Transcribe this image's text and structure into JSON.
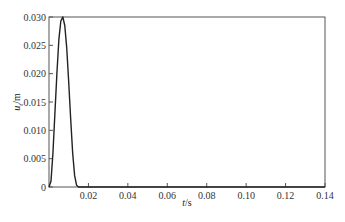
{
  "chart_data": {
    "type": "line",
    "title": "",
    "xlabel": "t/s",
    "ylabel": "u_t/m",
    "xlim": [
      0,
      0.14
    ],
    "ylim": [
      0,
      0.03
    ],
    "grid": false,
    "legend": null,
    "x_ticks": [
      0.02,
      0.04,
      0.06,
      0.08,
      0.1,
      0.12,
      0.14
    ],
    "x_tick_labels": [
      "0.02",
      "0.04",
      "0.06",
      "0.08",
      "0.10",
      "0.12",
      "0.14"
    ],
    "y_ticks": [
      0,
      0.005,
      0.01,
      0.015,
      0.02,
      0.025,
      0.03
    ],
    "y_tick_labels": [
      "0",
      "0.005",
      "0.010",
      "0.015",
      "0.020",
      "0.025",
      "0.030"
    ],
    "series": [
      {
        "name": "u_t",
        "color": "#222222",
        "x": [
          0,
          0.001,
          0.002,
          0.003,
          0.004,
          0.005,
          0.006,
          0.007,
          0.008,
          0.009,
          0.01,
          0.011,
          0.012,
          0.013,
          0.014,
          0.015,
          0.14
        ],
        "y": [
          0,
          0.001,
          0.006,
          0.013,
          0.02,
          0.026,
          0.0293,
          0.03,
          0.0285,
          0.0245,
          0.0185,
          0.012,
          0.006,
          0.002,
          0.0003,
          0,
          0
        ]
      }
    ]
  },
  "labels": {
    "x_axis_main": "t",
    "x_axis_unit": "/s",
    "y_axis_main": "u",
    "y_axis_sub": "t",
    "y_axis_unit": "/m"
  }
}
